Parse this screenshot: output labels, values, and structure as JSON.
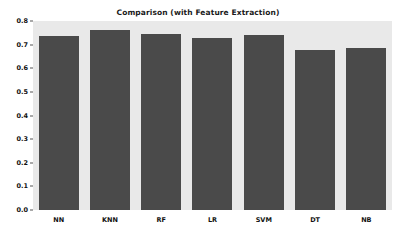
{
  "chart_data": {
    "type": "bar",
    "title": "Comparison (with Feature Extraction)",
    "xlabel": "",
    "ylabel": "",
    "categories": [
      "NN",
      "KNN",
      "RF",
      "LR",
      "SVM",
      "DT",
      "NB"
    ],
    "values": [
      0.735,
      0.762,
      0.746,
      0.726,
      0.741,
      0.678,
      0.687
    ],
    "ylim": [
      0.0,
      0.8
    ],
    "yticks": [
      "0.0",
      "0.1",
      "0.2",
      "0.3",
      "0.4",
      "0.5",
      "0.6",
      "0.7",
      "0.8"
    ],
    "ytick_values": [
      0.0,
      0.1,
      0.2,
      0.3,
      0.4,
      0.5,
      0.6,
      0.7,
      0.8
    ],
    "grid": false,
    "legend": null,
    "bar_color": "#4a4a4a",
    "plot_background": "#e9e9e9",
    "figure_background": "#ffffff",
    "tick_label_color": "#111111",
    "title_color": "#1a1a1a"
  }
}
